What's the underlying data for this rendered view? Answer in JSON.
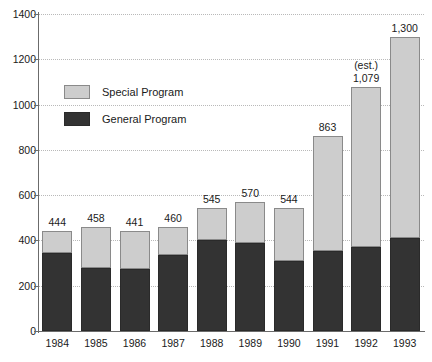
{
  "chart_data": {
    "type": "bar",
    "subtype": "stacked-bar",
    "title": "",
    "subtitle": "",
    "xlabel": "",
    "ylabel": "",
    "ylim": [
      0,
      1400
    ],
    "ytick_values": [
      0,
      200,
      400,
      600,
      800,
      1000,
      1200,
      1400
    ],
    "ytick_labels": [
      "0",
      "200",
      "400",
      "600",
      "800",
      "1000",
      "1200",
      "1400"
    ],
    "grid": true,
    "grid_axis": "y",
    "grid_style": "dotted",
    "legend_position": "upper-left-inside",
    "categories": [
      "1984",
      "1985",
      "1986",
      "1987",
      "1988",
      "1989",
      "1990",
      "1991",
      "1992",
      "1993"
    ],
    "series": [
      {
        "name": "General Program",
        "color": "#333333",
        "values": [
          345,
          277,
          272,
          335,
          400,
          390,
          310,
          355,
          370,
          413
        ]
      },
      {
        "name": "Special Program",
        "color": "#cdcdcd",
        "values": [
          99,
          181,
          169,
          125,
          145,
          180,
          234,
          508,
          709,
          887
        ]
      }
    ],
    "totals": [
      444,
      458,
      441,
      460,
      545,
      570,
      544,
      863,
      1079,
      1300
    ],
    "total_labels": [
      "444",
      "458",
      "441",
      "460",
      "545",
      "570",
      "544",
      "863",
      "1,079",
      "1,300"
    ],
    "annotations": [
      {
        "text": "(est.)",
        "category": "1992",
        "placement": "above-value-label"
      }
    ]
  },
  "legend": {
    "items": [
      {
        "label": "Special Program",
        "color": "#cdcdcd"
      },
      {
        "label": "General Program",
        "color": "#333333"
      }
    ]
  },
  "colors": {
    "general_program": "#333333",
    "special_program": "#cdcdcd",
    "gridline": "#b9b9b9",
    "axis": "#6b6b6b",
    "text": "#1a1a1a",
    "background": "#ffffff"
  }
}
